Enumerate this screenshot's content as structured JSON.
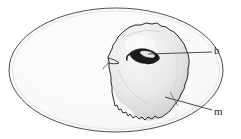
{
  "figure": {
    "type": "scientific-line-drawing",
    "background_color": "#ffffff",
    "ink_color": "#2c2c2c",
    "fill_color": "#f2f2f2",
    "shade_color": "#d8d8d8",
    "dark_color": "#1a1a1a"
  },
  "labels": {
    "blastoderm": {
      "text": "b",
      "leader_from_x": 212,
      "leader_from_y": 52,
      "leader_to_x": 148,
      "leader_to_y": 54
    },
    "membrane": {
      "text": "m",
      "leader_from_x": 212,
      "leader_from_y": 110,
      "leader_to_x": 165,
      "leader_to_y": 97
    }
  },
  "shapes": {
    "egg_outline": {
      "name": "egg-ellipse",
      "center_x": 116,
      "center_y": 70,
      "radius_x": 107,
      "radius_y": 62
    },
    "yolk_mass": {
      "name": "irregular-membrane-blob",
      "center_x": 150,
      "center_y": 72
    },
    "blastoderm_mark": {
      "name": "dark-blastoderm-arrowhead",
      "center_x": 143,
      "center_y": 56
    }
  }
}
